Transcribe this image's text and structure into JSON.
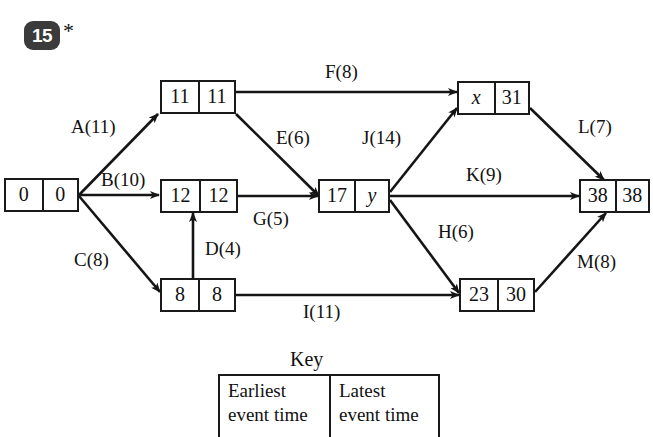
{
  "question": {
    "number": "15",
    "star": "*"
  },
  "diagram": {
    "type": "activity-network",
    "nodes": [
      {
        "id": "n0",
        "earliest": "0",
        "latest": "0"
      },
      {
        "id": "n11",
        "earliest": "11",
        "latest": "11"
      },
      {
        "id": "n12",
        "earliest": "12",
        "latest": "12"
      },
      {
        "id": "n8",
        "earliest": "8",
        "latest": "8"
      },
      {
        "id": "n17",
        "earliest": "17",
        "latest": "y"
      },
      {
        "id": "nx",
        "earliest": "x",
        "latest": "31"
      },
      {
        "id": "n23",
        "earliest": "23",
        "latest": "30"
      },
      {
        "id": "n38",
        "earliest": "38",
        "latest": "38"
      }
    ],
    "activities": [
      {
        "name": "A",
        "duration": "11",
        "label": "A(11)",
        "from": "n0",
        "to": "n11"
      },
      {
        "name": "B",
        "duration": "10",
        "label": "B(10)",
        "from": "n0",
        "to": "n12"
      },
      {
        "name": "C",
        "duration": "8",
        "label": "C(8)",
        "from": "n0",
        "to": "n8"
      },
      {
        "name": "D",
        "duration": "4",
        "label": "D(4)",
        "from": "n8",
        "to": "n12"
      },
      {
        "name": "E",
        "duration": "6",
        "label": "E(6)",
        "from": "n11",
        "to": "n17"
      },
      {
        "name": "F",
        "duration": "8",
        "label": "F(8)",
        "from": "n11",
        "to": "nx"
      },
      {
        "name": "G",
        "duration": "5",
        "label": "G(5)",
        "from": "n12",
        "to": "n17"
      },
      {
        "name": "H",
        "duration": "6",
        "label": "H(6)",
        "from": "n17",
        "to": "n23"
      },
      {
        "name": "I",
        "duration": "11",
        "label": "I(11)",
        "from": "n8",
        "to": "n23"
      },
      {
        "name": "J",
        "duration": "14",
        "label": "J(14)",
        "from": "n17",
        "to": "nx"
      },
      {
        "name": "K",
        "duration": "9",
        "label": "K(9)",
        "from": "n17",
        "to": "n38"
      },
      {
        "name": "L",
        "duration": "7",
        "label": "L(7)",
        "from": "nx",
        "to": "n38"
      },
      {
        "name": "M",
        "duration": "8",
        "label": "M(8)",
        "from": "n23",
        "to": "n38"
      }
    ]
  },
  "key": {
    "title": "Key",
    "left_label": "Earliest\nevent time",
    "right_label": "Latest\nevent time",
    "left_line1": "Earliest",
    "left_line2": "event time",
    "right_line1": "Latest",
    "right_line2": "event time"
  },
  "colors": {
    "ink": "#111111",
    "badge_bg": "#3b3b3b",
    "badge_text": "#ffffff",
    "page_bg": "#ffffff"
  }
}
